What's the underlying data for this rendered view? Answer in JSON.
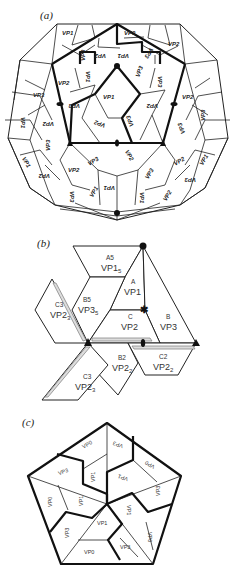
{
  "panels": {
    "a": {
      "label": "(a)",
      "description": "Icosahedral capsid with VP1, VP2, VP3 subunit arrangement",
      "top_labels": [
        "VP1",
        "VP3",
        "VP2",
        "VP3",
        "VP1",
        "VP3",
        "VP2",
        "VP1",
        "VP3",
        "VP2"
      ],
      "center_labels": [
        "VP2",
        "VP1",
        "VP3",
        "VP1",
        "VP2",
        "VP3",
        "VP2",
        "VP1",
        "VP3"
      ],
      "left_labels": [
        "VP3",
        "VP1",
        "VP2",
        "VP1",
        "VP3",
        "VP2",
        "VP3"
      ],
      "right_labels": [
        "VP2",
        "VP3",
        "VP2",
        "VP1",
        "VP3"
      ],
      "bottom_labels": [
        "VP3",
        "VP2",
        "VP1",
        "VP3",
        "VP1",
        "VP2",
        "VP3",
        "VP2",
        "VP1",
        "VP3",
        "VP1",
        "VP2"
      ]
    },
    "b": {
      "label": "(b)",
      "units": [
        {
          "sub": "A5",
          "name": "VP1",
          "index": "5"
        },
        {
          "sub": "A",
          "name": "VP1",
          "index": ""
        },
        {
          "sub": "B5",
          "name": "VP3",
          "index": "5"
        },
        {
          "sub": "C",
          "name": "VP2",
          "index": ""
        },
        {
          "sub": "B",
          "name": "VP3",
          "index": ""
        },
        {
          "sub": "C3",
          "name": "VP2",
          "index": "3"
        },
        {
          "sub": "B2",
          "name": "VP2",
          "index": "2"
        },
        {
          "sub": "C2",
          "name": "VP2",
          "index": "2"
        },
        {
          "sub": "C3",
          "name": "VP2",
          "index": "3"
        }
      ]
    },
    "c": {
      "label": "(c)",
      "pentagon_labels": [
        "VP0",
        "VP3",
        "VP0",
        "VP1",
        "VP3",
        "VP1",
        "VP3",
        "VP0",
        "VP1",
        "VP3",
        "VP1",
        "VP0",
        "VP1",
        "VP3",
        "VP1",
        "VP0",
        "VP3",
        "VP0"
      ]
    }
  }
}
